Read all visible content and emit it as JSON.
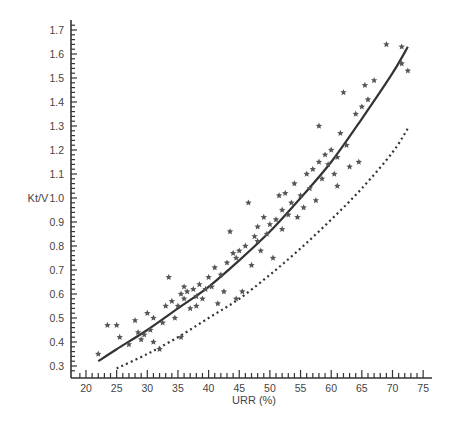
{
  "chart_data": {
    "type": "scatter",
    "title": "",
    "xlabel": "URR (%)",
    "ylabel": "Kt/V",
    "xlim": [
      18,
      76
    ],
    "ylim": [
      0.28,
      1.75
    ],
    "xticks": [
      20,
      25,
      30,
      35,
      40,
      45,
      50,
      55,
      60,
      65,
      70,
      75
    ],
    "yticks": [
      0.3,
      0.4,
      0.5,
      0.6,
      0.7,
      0.8,
      0.9,
      1.0,
      1.1,
      1.2,
      1.3,
      1.4,
      1.5,
      1.6,
      1.7
    ],
    "grid": false,
    "legend": null,
    "marker": "*",
    "series": [
      {
        "name": "measured",
        "type": "scatter",
        "points": [
          [
            22,
            0.35
          ],
          [
            23.5,
            0.47
          ],
          [
            25,
            0.47
          ],
          [
            25.5,
            0.42
          ],
          [
            27,
            0.39
          ],
          [
            28,
            0.49
          ],
          [
            28.5,
            0.44
          ],
          [
            29,
            0.41
          ],
          [
            29.5,
            0.43
          ],
          [
            30,
            0.52
          ],
          [
            30.5,
            0.45
          ],
          [
            31,
            0.4
          ],
          [
            31,
            0.5
          ],
          [
            32,
            0.37
          ],
          [
            32.5,
            0.48
          ],
          [
            33,
            0.55
          ],
          [
            33.5,
            0.67
          ],
          [
            34,
            0.57
          ],
          [
            34.5,
            0.5
          ],
          [
            35,
            0.55
          ],
          [
            35.5,
            0.42
          ],
          [
            35.5,
            0.6
          ],
          [
            36,
            0.63
          ],
          [
            36,
            0.58
          ],
          [
            36.5,
            0.61
          ],
          [
            37,
            0.54
          ],
          [
            37.5,
            0.62
          ],
          [
            38,
            0.59
          ],
          [
            38,
            0.55
          ],
          [
            38.5,
            0.64
          ],
          [
            39,
            0.58
          ],
          [
            39.5,
            0.62
          ],
          [
            40,
            0.67
          ],
          [
            40.5,
            0.63
          ],
          [
            41,
            0.71
          ],
          [
            41.5,
            0.56
          ],
          [
            42,
            0.68
          ],
          [
            42.5,
            0.61
          ],
          [
            43,
            0.73
          ],
          [
            43.5,
            0.86
          ],
          [
            44,
            0.77
          ],
          [
            44.5,
            0.58
          ],
          [
            44.5,
            0.75
          ],
          [
            45,
            0.78
          ],
          [
            45.5,
            0.61
          ],
          [
            46,
            0.8
          ],
          [
            46.5,
            0.98
          ],
          [
            47,
            0.72
          ],
          [
            47.5,
            0.84
          ],
          [
            48,
            0.82
          ],
          [
            48,
            0.88
          ],
          [
            48.5,
            0.78
          ],
          [
            49,
            0.92
          ],
          [
            49.5,
            0.85
          ],
          [
            50,
            0.89
          ],
          [
            50.5,
            0.75
          ],
          [
            51,
            0.91
          ],
          [
            51.5,
            1.01
          ],
          [
            52,
            0.95
          ],
          [
            52,
            0.87
          ],
          [
            52.5,
            1.02
          ],
          [
            53,
            0.93
          ],
          [
            53.5,
            0.98
          ],
          [
            54,
            1.06
          ],
          [
            54.5,
            0.92
          ],
          [
            55,
            1.01
          ],
          [
            55.5,
            0.96
          ],
          [
            56,
            1.1
          ],
          [
            56.5,
            1.04
          ],
          [
            57,
            1.12
          ],
          [
            57.5,
            0.99
          ],
          [
            58,
            1.15
          ],
          [
            58,
            1.3
          ],
          [
            58.5,
            1.08
          ],
          [
            59,
            1.18
          ],
          [
            59.5,
            1.14
          ],
          [
            60,
            1.2
          ],
          [
            60.5,
            1.1
          ],
          [
            61,
            1.17
          ],
          [
            61,
            1.05
          ],
          [
            61.5,
            1.27
          ],
          [
            62,
            1.44
          ],
          [
            62.5,
            1.22
          ],
          [
            63,
            1.13
          ],
          [
            64,
            1.35
          ],
          [
            64.5,
            1.15
          ],
          [
            65,
            1.38
          ],
          [
            65.5,
            1.47
          ],
          [
            66,
            1.41
          ],
          [
            67,
            1.49
          ],
          [
            69,
            1.64
          ],
          [
            71.5,
            1.63
          ],
          [
            71.5,
            1.56
          ],
          [
            72.5,
            1.53
          ]
        ]
      },
      {
        "name": "fitted curve (solid)",
        "type": "line",
        "style": "solid",
        "x": [
          22,
          25,
          30,
          35,
          40,
          45,
          50,
          55,
          60,
          65,
          70,
          72.5
        ],
        "y": [
          0.32,
          0.37,
          0.45,
          0.54,
          0.63,
          0.74,
          0.86,
          1.0,
          1.15,
          1.33,
          1.52,
          1.63
        ]
      },
      {
        "name": "reference curve (dotted)",
        "type": "line",
        "style": "dotted",
        "x": [
          25,
          30,
          35,
          40,
          45,
          50,
          55,
          60,
          65,
          70,
          72.5
        ],
        "y": [
          0.29,
          0.35,
          0.42,
          0.5,
          0.58,
          0.68,
          0.79,
          0.91,
          1.04,
          1.19,
          1.29
        ]
      }
    ]
  }
}
